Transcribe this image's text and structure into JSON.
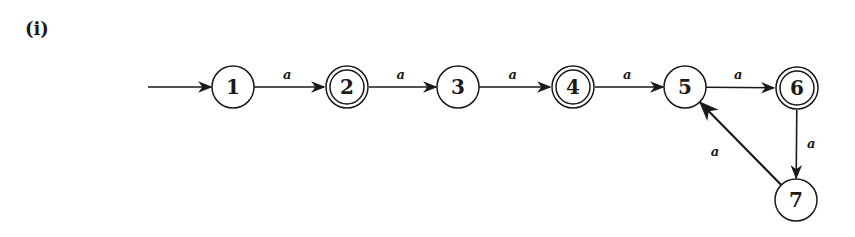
{
  "figure": {
    "label": "(i)"
  },
  "automaton": {
    "start_state": "1",
    "states": [
      {
        "id": "1",
        "label": "1",
        "accepting": false,
        "x": 233,
        "y": 87
      },
      {
        "id": "2",
        "label": "2",
        "accepting": true,
        "x": 347,
        "y": 87
      },
      {
        "id": "3",
        "label": "3",
        "accepting": false,
        "x": 458,
        "y": 87
      },
      {
        "id": "4",
        "label": "4",
        "accepting": true,
        "x": 573,
        "y": 87
      },
      {
        "id": "5",
        "label": "5",
        "accepting": false,
        "x": 685,
        "y": 87
      },
      {
        "id": "6",
        "label": "6",
        "accepting": true,
        "x": 797,
        "y": 88
      },
      {
        "id": "7",
        "label": "7",
        "accepting": false,
        "x": 796,
        "y": 200
      }
    ],
    "transitions": [
      {
        "from": "1",
        "to": "2",
        "symbol": "a"
      },
      {
        "from": "2",
        "to": "3",
        "symbol": "a"
      },
      {
        "from": "3",
        "to": "4",
        "symbol": "a"
      },
      {
        "from": "4",
        "to": "5",
        "symbol": "a"
      },
      {
        "from": "5",
        "to": "6",
        "symbol": "a"
      },
      {
        "from": "6",
        "to": "7",
        "symbol": "a"
      },
      {
        "from": "7",
        "to": "5",
        "symbol": "a"
      }
    ]
  },
  "colors": {
    "stroke": "#1a1a1a",
    "background": "#ffffff"
  }
}
